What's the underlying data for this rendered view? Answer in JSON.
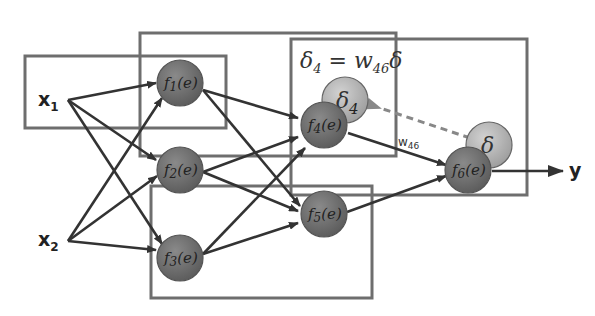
{
  "diagram": {
    "title": "",
    "inputs": [
      {
        "id": "x1",
        "label": "x",
        "sub": "1"
      },
      {
        "id": "x2",
        "label": "x",
        "sub": "2"
      }
    ],
    "output": {
      "label": "y"
    },
    "nodes": [
      {
        "id": "n1",
        "label": "f",
        "sub": "1",
        "arg": "(e)"
      },
      {
        "id": "n2",
        "label": "f",
        "sub": "2",
        "arg": "(e)"
      },
      {
        "id": "n3",
        "label": "f",
        "sub": "3",
        "arg": "(e)"
      },
      {
        "id": "n4",
        "label": "f",
        "sub": "4",
        "arg": "(e)"
      },
      {
        "id": "n5",
        "label": "f",
        "sub": "5",
        "arg": "(e)"
      },
      {
        "id": "n6",
        "label": "f",
        "sub": "6",
        "arg": "(e)"
      }
    ],
    "error_nodes": [
      {
        "id": "d4",
        "label": "δ",
        "sub": "4"
      },
      {
        "id": "d6",
        "label": "δ",
        "sub": ""
      }
    ],
    "equation": {
      "lhs": "δ",
      "lhs_sub": "4",
      "eq": " = ",
      "w": "w",
      "w_sub": "46",
      "rhs": "δ"
    },
    "weight_label": {
      "w": "w",
      "sub": "46"
    },
    "colors": {
      "node": "#6a6a6a",
      "delta_node": "#b5b5b5",
      "box": "#6e6e6e",
      "edge": "#333333",
      "dashed": "#888888"
    }
  }
}
